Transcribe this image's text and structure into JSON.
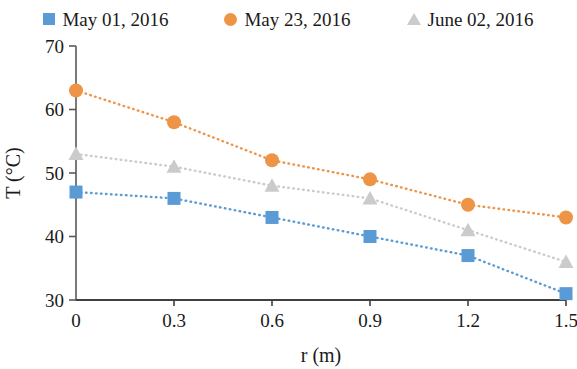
{
  "chart_data": {
    "type": "line",
    "title": "",
    "subtitle": "",
    "xlabel": "r (m)",
    "ylabel": "T (°C)",
    "xlim": [
      0,
      1.5
    ],
    "ylim": [
      30,
      70
    ],
    "xticks": [
      "0",
      "0.3",
      "0.6",
      "0.9",
      "1.2",
      "1.5"
    ],
    "xtick_values": [
      0,
      0.3,
      0.6,
      0.9,
      1.2,
      1.5
    ],
    "yticks": [
      "30",
      "40",
      "50",
      "60",
      "70"
    ],
    "ytick_values": [
      30,
      40,
      50,
      60,
      70
    ],
    "grid": false,
    "legend_position": "top-center",
    "x": [
      0,
      0.3,
      0.6,
      0.9,
      1.2,
      1.5
    ],
    "series": [
      {
        "name": "May 01, 2016",
        "marker": "square",
        "color": "#5B9BD5",
        "linestyle": "dotted",
        "values": [
          47,
          46,
          43,
          40,
          37,
          31
        ]
      },
      {
        "name": "May 23, 2016",
        "marker": "circle",
        "color": "#ED9447",
        "linestyle": "dotted",
        "values": [
          63,
          58,
          52,
          49,
          45,
          43
        ]
      },
      {
        "name": "June 02, 2016",
        "marker": "triangle",
        "color": "#C9CBCD",
        "linestyle": "dotted",
        "values": [
          53,
          51,
          48,
          46,
          41,
          36
        ]
      }
    ]
  },
  "legend": {
    "items": [
      {
        "label": "May 01, 2016",
        "color": "#5B9BD5",
        "marker": "square"
      },
      {
        "label": "May 23, 2016",
        "color": "#ED9447",
        "marker": "circle"
      },
      {
        "label": "June 02, 2016",
        "color": "#C9CBCD",
        "marker": "triangle"
      }
    ]
  },
  "axes": {
    "x_title": "r (m)",
    "y_title": "T (°C)"
  },
  "colors": {
    "axis": "#595959",
    "text": "#1a1a1a",
    "series_blue": "#5B9BD5",
    "series_orange": "#ED9447",
    "series_gray": "#C9CBCD"
  }
}
